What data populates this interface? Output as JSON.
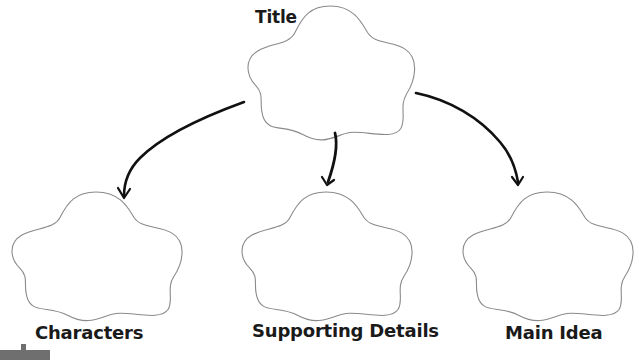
{
  "diagram": {
    "type": "graphic-organizer",
    "colors": {
      "background": "#ffffff",
      "cloud_stroke": "#8a8a8a",
      "arrow_stroke": "#111111",
      "label_text": "#1a1a1a",
      "corner_widget": "#6f6f6f"
    },
    "nodes": [
      {
        "id": "title",
        "label": "Title",
        "shape": "cloud"
      },
      {
        "id": "characters",
        "label": "Characters",
        "shape": "cloud"
      },
      {
        "id": "supporting",
        "label": "Supporting Details",
        "shape": "cloud"
      },
      {
        "id": "main",
        "label": "Main Idea",
        "shape": "cloud"
      }
    ],
    "edges": [
      {
        "from": "title",
        "to": "characters"
      },
      {
        "from": "title",
        "to": "supporting"
      },
      {
        "from": "title",
        "to": "main"
      }
    ]
  }
}
